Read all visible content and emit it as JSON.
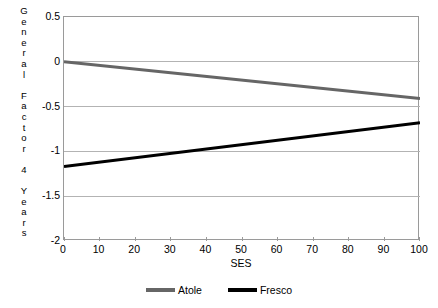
{
  "chart_data": {
    "type": "line",
    "title": "",
    "xlabel": "SES",
    "ylabel": "General Factor 4 Years",
    "ylabel_letters": [
      "G",
      "e",
      "n",
      "e",
      "r",
      "a",
      "l",
      "",
      "F",
      "a",
      "c",
      "t",
      "o",
      "r",
      "",
      "4",
      "",
      "Y",
      "e",
      "a",
      "r",
      "s"
    ],
    "x": [
      0,
      100
    ],
    "xlim": [
      0,
      100
    ],
    "ylim": [
      -2,
      0.5
    ],
    "xticks": [
      0,
      10,
      20,
      30,
      40,
      50,
      60,
      70,
      80,
      90,
      100
    ],
    "xtick_labels": [
      "0",
      "10",
      "20",
      "30",
      "40",
      "50",
      "60",
      "70",
      "80",
      "90",
      "100"
    ],
    "yticks": [
      0.5,
      0,
      -0.5,
      -1,
      -1.5,
      -2
    ],
    "ytick_labels": [
      "0.5",
      "0",
      "-0.5",
      "-1",
      "-1.5",
      "-2"
    ],
    "grid": "horizontal",
    "grid_color": "#b3b3b3",
    "frame_color": "#9a9a9a",
    "legend_position": "bottom-center",
    "series": [
      {
        "name": "Atole",
        "color": "#666666",
        "line_width": 3,
        "values": [
          0.0,
          -0.41
        ]
      },
      {
        "name": "Fresco",
        "color": "#000000",
        "line_width": 3,
        "values": [
          -1.17,
          -0.68
        ]
      }
    ]
  },
  "legend": {
    "items": [
      {
        "label": "Atole",
        "color": "#666666"
      },
      {
        "label": "Fresco",
        "color": "#000000"
      }
    ]
  }
}
